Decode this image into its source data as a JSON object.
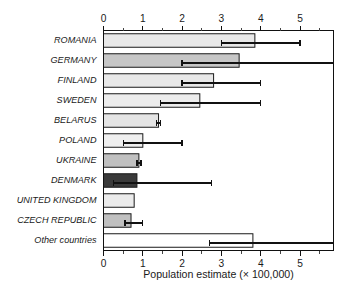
{
  "chart_data": {
    "type": "bar",
    "orientation": "horizontal",
    "title": "",
    "xlabel": "Population estimate (× 100,000)",
    "ylabel": "",
    "xlim": [
      0,
      5.85
    ],
    "xticks": [
      0,
      1,
      2,
      3,
      4,
      5
    ],
    "xtick_labels": [
      "0",
      "1",
      "2",
      "3",
      "4",
      "5"
    ],
    "minor_tick_step": 0.5,
    "grid": false,
    "legend": null,
    "top_axis": true,
    "bottom_axis": true,
    "categories": [
      "ROMANIA",
      "GERMANY",
      "FINLAND",
      "SWEDEN",
      "BELARUS",
      "POLAND",
      "UKRAINE",
      "DENMARK",
      "UNITED KINGDOM",
      "CZECH REPUBLIC",
      "Other countries"
    ],
    "values": [
      3.85,
      3.45,
      2.8,
      2.45,
      1.4,
      1.0,
      0.9,
      0.85,
      0.78,
      0.7,
      3.8
    ],
    "error_low": [
      3.0,
      2.0,
      2.0,
      1.45,
      1.35,
      0.5,
      0.85,
      0.25,
      null,
      0.55,
      2.7
    ],
    "error_high": [
      5.0,
      5.85,
      4.0,
      4.0,
      1.45,
      2.0,
      0.95,
      2.75,
      null,
      1.0,
      5.85
    ],
    "bar_colors": [
      "#e8e8e8",
      "#c6c6c6",
      "#e8e8e8",
      "#ececec",
      "#e4e4e4",
      "#efefef",
      "#c0c0c0",
      "#3a3a3a",
      "#ebebeb",
      "#c0c0c0",
      "#ffffff"
    ],
    "bar_edge_color": "#1a1a1a",
    "error_color": "#111111"
  }
}
